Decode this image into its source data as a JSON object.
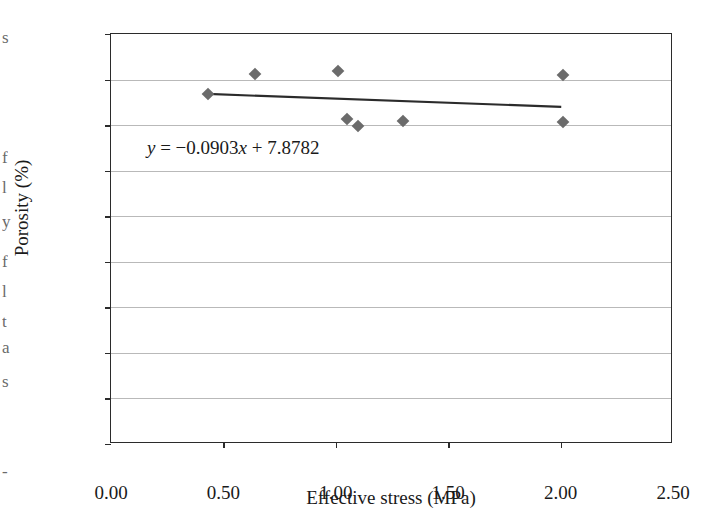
{
  "chart_data": {
    "type": "scatter",
    "title": "",
    "xlabel": "Effective stress (MPa)",
    "ylabel": "Porosity (%)",
    "xlim": [
      0.0,
      2.5
    ],
    "ylim": [
      4.0,
      8.5
    ],
    "xticks": [
      "0.00",
      "0.50",
      "1.00",
      "1.50",
      "2.00",
      "2.50"
    ],
    "xtick_values": [
      0.0,
      0.5,
      1.0,
      1.5,
      2.0,
      2.5
    ],
    "yticks": [
      "4.0",
      "4.5",
      "5.0",
      "5.5",
      "6.0",
      "6.5",
      "7.0",
      "7.5",
      "8.0",
      "8.5"
    ],
    "ytick_values": [
      4.0,
      4.5,
      5.0,
      5.5,
      6.0,
      6.5,
      7.0,
      7.5,
      8.0,
      8.5
    ],
    "grid": "horizontal",
    "legend": "none",
    "marker": "diamond",
    "marker_color": "#6b6b6b",
    "line_color": "#2b2b2b",
    "points": [
      {
        "x": 0.43,
        "y": 7.84
      },
      {
        "x": 0.64,
        "y": 8.06
      },
      {
        "x": 1.01,
        "y": 8.09
      },
      {
        "x": 1.05,
        "y": 7.57
      },
      {
        "x": 1.1,
        "y": 7.49
      },
      {
        "x": 1.3,
        "y": 7.55
      },
      {
        "x": 2.01,
        "y": 8.05
      },
      {
        "x": 2.01,
        "y": 7.53
      }
    ],
    "trendline": {
      "slope": -0.0903,
      "intercept": 7.8782,
      "x_start": 0.43,
      "x_end": 2.01
    },
    "annotations": [
      {
        "name": "regression-equation",
        "prefix_var": "y",
        "text": " = −0.0903",
        "var2": "x",
        "suffix": " + 7.8782",
        "x": 0.16,
        "y": 7.24
      }
    ]
  },
  "edge_fragments": [
    {
      "text": "s",
      "top": 28
    },
    {
      "text": "f",
      "top": 148
    },
    {
      "text": "l",
      "top": 178
    },
    {
      "text": "y",
      "top": 212
    },
    {
      "text": "f",
      "top": 252
    },
    {
      "text": "l",
      "top": 282
    },
    {
      "text": "t",
      "top": 312
    },
    {
      "text": "a",
      "top": 338
    },
    {
      "text": "s",
      "top": 372
    },
    {
      "text": "-",
      "top": 462
    }
  ]
}
